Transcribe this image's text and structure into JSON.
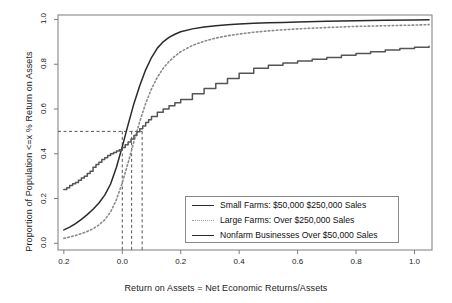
{
  "chart_data": {
    "type": "line",
    "title": "",
    "subtitle": "",
    "xlabel": "Return on Assets = Net Economic Returns/Assets",
    "ylabel": "Proportion of Population <=x % Return on Assets",
    "xlim": [
      -0.22,
      1.06
    ],
    "ylim": [
      -0.03,
      1.02
    ],
    "xticks": [
      -0.2,
      0.0,
      0.2,
      0.4,
      0.6,
      0.8,
      1.0
    ],
    "xticklabels": [
      "0.2",
      "0.0",
      "0.2",
      "0.4",
      "0.6",
      "0.8",
      "1.0"
    ],
    "yticks": [
      0.0,
      0.2,
      0.4,
      0.6,
      0.8,
      1.0
    ],
    "yticklabels": [
      "0.0",
      "0.2",
      "0.4",
      "0.6",
      "0.8",
      "1.0"
    ],
    "grid": false,
    "legend_position": "lower right",
    "annotations": [
      {
        "kind": "hline",
        "y": 0.5,
        "style": "dashed",
        "label": "median reference"
      },
      {
        "kind": "vline",
        "x": 0.0,
        "style": "dashed",
        "label": "Small Farms median"
      },
      {
        "kind": "vline",
        "x": 0.032,
        "style": "dashed",
        "label": "Nonfarm Businesses median"
      },
      {
        "kind": "vline",
        "x": 0.068,
        "style": "dashed",
        "label": "Large Farms median"
      }
    ],
    "series": [
      {
        "name": "Small Farms: $50,000  $250,000 Sales",
        "style": "solid",
        "color": "#2a2a2a",
        "x": [
          -0.2,
          -0.18,
          -0.16,
          -0.14,
          -0.12,
          -0.1,
          -0.08,
          -0.06,
          -0.04,
          -0.02,
          0.0,
          0.02,
          0.04,
          0.06,
          0.08,
          0.1,
          0.12,
          0.14,
          0.16,
          0.18,
          0.2,
          0.24,
          0.28,
          0.32,
          0.36,
          0.4,
          0.45,
          0.5,
          0.55,
          0.6,
          0.7,
          0.8,
          0.9,
          1.0,
          1.05
        ],
        "y": [
          0.06,
          0.072,
          0.088,
          0.107,
          0.128,
          0.152,
          0.18,
          0.215,
          0.265,
          0.34,
          0.432,
          0.53,
          0.625,
          0.705,
          0.775,
          0.83,
          0.872,
          0.9,
          0.92,
          0.934,
          0.945,
          0.958,
          0.966,
          0.972,
          0.976,
          0.98,
          0.983,
          0.985,
          0.987,
          0.989,
          0.992,
          0.994,
          0.996,
          0.998,
          0.999
        ]
      },
      {
        "name": "Large Farms: Over $250,000 Sales",
        "style": "dotted",
        "color": "#8a8a8a",
        "x": [
          -0.2,
          -0.18,
          -0.16,
          -0.14,
          -0.12,
          -0.1,
          -0.08,
          -0.06,
          -0.04,
          -0.02,
          0.0,
          0.02,
          0.04,
          0.06,
          0.08,
          0.1,
          0.12,
          0.14,
          0.16,
          0.18,
          0.2,
          0.24,
          0.28,
          0.32,
          0.36,
          0.4,
          0.45,
          0.5,
          0.55,
          0.6,
          0.7,
          0.8,
          0.9,
          1.0,
          1.05
        ],
        "y": [
          0.022,
          0.028,
          0.035,
          0.043,
          0.053,
          0.065,
          0.082,
          0.105,
          0.14,
          0.195,
          0.27,
          0.36,
          0.455,
          0.545,
          0.625,
          0.69,
          0.742,
          0.782,
          0.812,
          0.836,
          0.856,
          0.884,
          0.903,
          0.917,
          0.927,
          0.935,
          0.943,
          0.949,
          0.954,
          0.958,
          0.964,
          0.969,
          0.972,
          0.975,
          0.977
        ]
      },
      {
        "name": "Nonfarm Businesses Over $50,000 Sales",
        "style": "solid-step",
        "color": "#555555",
        "x": [
          -0.2,
          -0.19,
          -0.18,
          -0.17,
          -0.16,
          -0.15,
          -0.14,
          -0.13,
          -0.12,
          -0.11,
          -0.1,
          -0.09,
          -0.08,
          -0.07,
          -0.06,
          -0.05,
          -0.04,
          -0.03,
          -0.02,
          -0.01,
          0.0,
          0.01,
          0.02,
          0.03,
          0.04,
          0.05,
          0.06,
          0.07,
          0.08,
          0.09,
          0.1,
          0.12,
          0.14,
          0.16,
          0.18,
          0.2,
          0.24,
          0.28,
          0.32,
          0.36,
          0.4,
          0.45,
          0.5,
          0.55,
          0.6,
          0.65,
          0.7,
          0.75,
          0.8,
          0.85,
          0.9,
          0.95,
          1.0,
          1.05
        ],
        "y": [
          0.24,
          0.248,
          0.258,
          0.266,
          0.272,
          0.282,
          0.292,
          0.3,
          0.312,
          0.322,
          0.34,
          0.352,
          0.362,
          0.374,
          0.382,
          0.392,
          0.4,
          0.406,
          0.412,
          0.418,
          0.428,
          0.44,
          0.452,
          0.466,
          0.482,
          0.498,
          0.512,
          0.524,
          0.54,
          0.552,
          0.566,
          0.586,
          0.6,
          0.614,
          0.628,
          0.642,
          0.668,
          0.692,
          0.714,
          0.736,
          0.76,
          0.782,
          0.796,
          0.806,
          0.814,
          0.822,
          0.83,
          0.84,
          0.848,
          0.856,
          0.864,
          0.87,
          0.876,
          0.88
        ]
      }
    ]
  },
  "legend": {
    "entries": [
      {
        "label": "Small Farms: $50,000  $250,000 Sales",
        "style": "solid"
      },
      {
        "label": "Large Farms: Over $250,000 Sales",
        "style": "dotted"
      },
      {
        "label": "Nonfarm Businesses Over $50,000 Sales",
        "style": "solid"
      }
    ]
  }
}
